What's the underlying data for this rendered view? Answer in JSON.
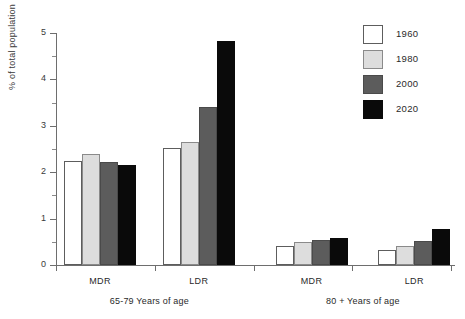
{
  "chart_data": {
    "type": "bar",
    "title": "",
    "xlabel": "",
    "ylabel": "% of total population",
    "ylim": [
      0,
      5
    ],
    "yticks": [
      0,
      1,
      2,
      3,
      4,
      5
    ],
    "ytick_labels": [
      "0",
      "1",
      "2",
      "3",
      "4",
      "5"
    ],
    "yminor_step": 0.5,
    "grid": false,
    "legend_position": "top-right",
    "legend_entries": [
      "1960",
      "1980",
      "2000",
      "2020"
    ],
    "series": [
      {
        "name": "1960",
        "color": "#ffffff",
        "values": [
          2.25,
          2.52,
          0.42,
          0.33
        ]
      },
      {
        "name": "1980",
        "color": "#dddddd",
        "values": [
          2.4,
          2.65,
          0.5,
          0.4
        ]
      },
      {
        "name": "2000",
        "color": "#5c5c5c",
        "values": [
          2.23,
          3.4,
          0.53,
          0.52
        ]
      },
      {
        "name": "2020",
        "color": "#0a0a0a",
        "values": [
          2.15,
          4.83,
          0.58,
          0.78
        ]
      }
    ],
    "categories": [
      "MDR",
      "LDR",
      "MDR",
      "LDR"
    ],
    "group_labels": [
      "65-79 Years of age",
      "80 + Years of age"
    ],
    "groups": [
      {
        "label": "65-79 Years of age",
        "categories": [
          {
            "name": "MDR",
            "values": [
              2.25,
              2.4,
              2.23,
              2.15
            ]
          },
          {
            "name": "LDR",
            "values": [
              2.52,
              2.65,
              3.4,
              4.83
            ]
          }
        ]
      },
      {
        "label": "80 + Years of age",
        "categories": [
          {
            "name": "MDR",
            "values": [
              0.42,
              0.5,
              0.53,
              0.58
            ]
          },
          {
            "name": "LDR",
            "values": [
              0.33,
              0.4,
              0.52,
              0.78
            ]
          }
        ]
      }
    ]
  },
  "axis": {
    "y_label": "% of total population",
    "y_tick_labels": [
      "0",
      "1",
      "2",
      "3",
      "4",
      "5"
    ]
  },
  "legend": {
    "items": [
      {
        "label": "1960",
        "swatch": "white-swatch"
      },
      {
        "label": "1980",
        "swatch": "light-gray-swatch"
      },
      {
        "label": "2000",
        "swatch": "dark-gray-swatch"
      },
      {
        "label": "2020",
        "swatch": "black-swatch"
      }
    ]
  },
  "categories": [
    {
      "label": "MDR"
    },
    {
      "label": "LDR"
    },
    {
      "label": "MDR"
    },
    {
      "label": "LDR"
    }
  ],
  "groups": [
    {
      "label": "65-79 Years of age"
    },
    {
      "label": "80 + Years of age"
    }
  ]
}
